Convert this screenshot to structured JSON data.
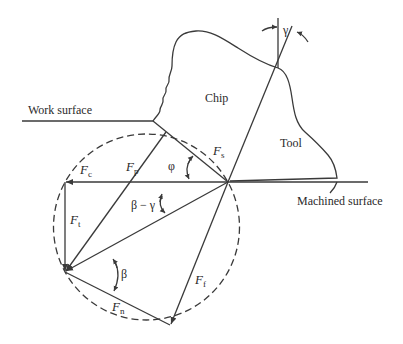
{
  "diagram": {
    "regions": {
      "chip": "Chip",
      "tool": "Tool"
    },
    "surfaces": {
      "work_surface": "Work surface",
      "machined_surface": "Machined surface"
    },
    "forces": {
      "fc": {
        "sym": "F",
        "sub": "c"
      },
      "ft": {
        "sym": "F",
        "sub": "t"
      },
      "fp": {
        "sym": "F",
        "sub": "p"
      },
      "fs": {
        "sym": "F",
        "sub": "s"
      },
      "ff": {
        "sym": "F",
        "sub": "f"
      },
      "fn": {
        "sym": "F",
        "sub": "n"
      }
    },
    "angles": {
      "rake": "γ",
      "shear": "φ",
      "friction": "β",
      "beta_minus_gamma": "β − γ"
    },
    "colors": {
      "line": "#3a3a3a",
      "background": "#ffffff"
    }
  }
}
